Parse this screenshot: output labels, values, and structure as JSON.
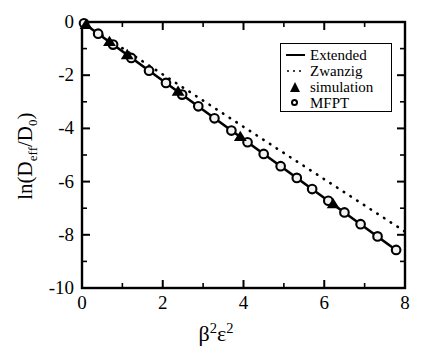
{
  "chart_data": {
    "type": "line",
    "title": "",
    "xlabel": "β²ε²",
    "ylabel": "ln(D_eff/D_0)",
    "xlim": [
      0,
      8
    ],
    "ylim": [
      -10,
      0
    ],
    "grid": false,
    "legend_position": "upper-right",
    "xticks": [
      "0",
      "2",
      "4",
      "6",
      "8"
    ],
    "xtick_values": [
      0,
      2,
      4,
      6,
      8
    ],
    "xminor_values": [
      1,
      3,
      5,
      7
    ],
    "yticks": [
      "0",
      "-2",
      "-4",
      "-6",
      "-8",
      "-10"
    ],
    "ytick_values": [
      0,
      -2,
      -4,
      -6,
      -8,
      -10
    ],
    "yminor_values": [
      -1,
      -3,
      -5,
      -7,
      -9
    ],
    "series": [
      {
        "name": "Extended",
        "style": "solid-line",
        "color": "#000000",
        "x": [
          0.0,
          7.82
        ],
        "values": [
          0.0,
          -8.62
        ]
      },
      {
        "name": "Zwanzig",
        "style": "dotted-line",
        "color": "#000000",
        "x": [
          0.0,
          8.0
        ],
        "values": [
          0.0,
          -7.88
        ]
      },
      {
        "name": "simulation",
        "style": "filled-triangle-markers",
        "color": "#000000",
        "x": [
          0.1,
          0.68,
          1.12,
          2.38,
          3.92,
          6.22
        ],
        "values": [
          -0.11,
          -0.75,
          -1.24,
          -2.62,
          -4.32,
          -6.85
        ]
      },
      {
        "name": "MFPT",
        "style": "open-circle-markers",
        "color": "#000000",
        "x": [
          0.05,
          0.4,
          0.77,
          1.22,
          1.66,
          2.08,
          2.48,
          2.88,
          3.28,
          3.7,
          4.1,
          4.5,
          4.92,
          5.32,
          5.7,
          6.1,
          6.5,
          6.9,
          7.32,
          7.78
        ],
        "values": [
          -0.05,
          -0.44,
          -0.85,
          -1.35,
          -1.83,
          -2.29,
          -2.73,
          -3.17,
          -3.62,
          -4.08,
          -4.52,
          -4.96,
          -5.42,
          -5.86,
          -6.28,
          -6.72,
          -7.16,
          -7.6,
          -8.06,
          -8.57
        ]
      }
    ]
  },
  "legend": {
    "items": [
      {
        "label": "Extended",
        "key": "solid-line-key"
      },
      {
        "label": "Zwanzig",
        "key": "dotted-line-key"
      },
      {
        "label": "simulation",
        "key": "triangle-marker-key"
      },
      {
        "label": "MFPT",
        "key": "circle-marker-key"
      }
    ]
  },
  "axes": {
    "x_label_base1": "β",
    "x_label_sup1": "2",
    "x_label_base2": "ε",
    "x_label_sup2": "2",
    "y_label_pre": "ln(D",
    "y_label_sub1": "eff",
    "y_label_mid": "/D",
    "y_label_sub2": "0",
    "y_label_post": ")"
  }
}
